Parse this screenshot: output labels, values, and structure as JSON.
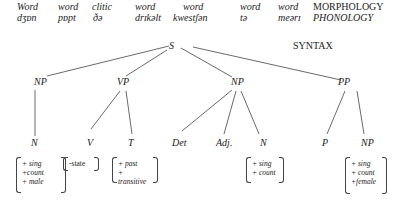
{
  "morphology_row": {
    "words": [
      "Word",
      "word",
      "clitic",
      "word",
      "word",
      "word",
      "word"
    ],
    "label": "MORPHOLOGY"
  },
  "phonology_row": {
    "words": [
      "dʒɒn",
      "pɒpt",
      "ðə",
      "drɪkəlt",
      "kwestʃən",
      "tə",
      "meərɪ"
    ],
    "label": "PHONOLOGY"
  },
  "syntax": {
    "label": "SYNTAX",
    "root": "S",
    "phrases": [
      "NP",
      "VP",
      "NP",
      "PP"
    ],
    "terminals": [
      "N",
      "V",
      "T",
      "Det",
      "Adj.",
      "N",
      "P",
      "NP"
    ]
  },
  "features": {
    "n1": [
      "+ sing",
      "+count",
      "+ male"
    ],
    "v": [
      "-state"
    ],
    "t": [
      "+ past",
      "+ transitive"
    ],
    "n2": [
      "+ sing",
      "+ count"
    ],
    "np": [
      "+ sing",
      "+ count",
      "+female"
    ]
  }
}
